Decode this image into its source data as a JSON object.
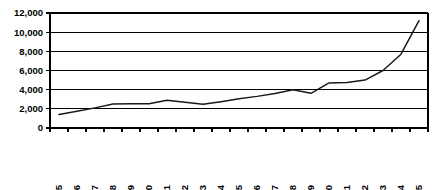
{
  "chart_data": {
    "type": "line",
    "title": "",
    "subtitle": "",
    "xlabel": "",
    "ylabel": "",
    "grid": "horizontal",
    "legend": "none",
    "xlim_categories": 21,
    "ylim": [
      0,
      12000
    ],
    "ytick_step": 2000,
    "ytick_labels": [
      "12,000",
      "10,000",
      "8,000",
      "6,000",
      "4,000",
      "2,000",
      "0"
    ],
    "ytick_values": [
      12000,
      10000,
      8000,
      6000,
      4000,
      2000,
      0
    ],
    "categories": [
      "1985",
      "1986",
      "1987",
      "1988",
      "1989",
      "1990",
      "1991",
      "1992",
      "1993",
      "1994",
      "1995",
      "1996",
      "1997",
      "1998",
      "1999",
      "2000",
      "2001",
      "2002",
      "2003",
      "2004",
      "2005"
    ],
    "series": [
      {
        "name": "",
        "color": "#1a1a1a",
        "values": [
          1400,
          1750,
          2100,
          2500,
          2520,
          2520,
          2900,
          2700,
          2480,
          2750,
          3050,
          3300,
          3600,
          4000,
          3620,
          4700,
          4750,
          5000,
          6000,
          7700,
          11200
        ]
      }
    ],
    "xtick_label_rotation": -90
  },
  "geometry": {
    "plot_left": 50,
    "plot_right": 428,
    "plot_top": 13,
    "plot_bottom": 128
  }
}
